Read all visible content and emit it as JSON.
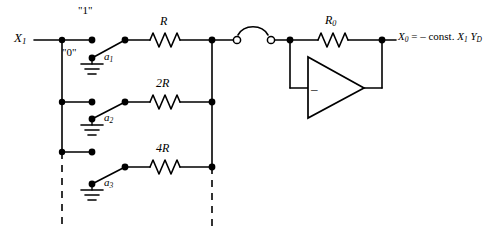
{
  "figure": {
    "type": "circuit-schematic",
    "input_label": "X",
    "input_sub": "1",
    "logic_high_label": "\"1\"",
    "logic_low_label": "\"0\"",
    "switches": [
      {
        "name": "a",
        "sub": "1"
      },
      {
        "name": "a",
        "sub": "2"
      },
      {
        "name": "a",
        "sub": "3"
      }
    ],
    "resistors": [
      {
        "label": "R",
        "weight": 1
      },
      {
        "label": "2R",
        "weight": 2
      },
      {
        "label": "4R",
        "weight": 4
      }
    ],
    "feedback_resistor": {
      "label": "R",
      "sub": "0"
    },
    "amplifier": {
      "input_sign": "–"
    },
    "output": {
      "symbol": "X",
      "symbol_sub": "0",
      "equation": "= – const.",
      "factor1": "X",
      "factor1_sub": "1",
      "factor2": "Y",
      "factor2_sub": "D"
    },
    "colors": {
      "wire": "#000000",
      "background": "#ffffff",
      "node": "#000000"
    }
  }
}
